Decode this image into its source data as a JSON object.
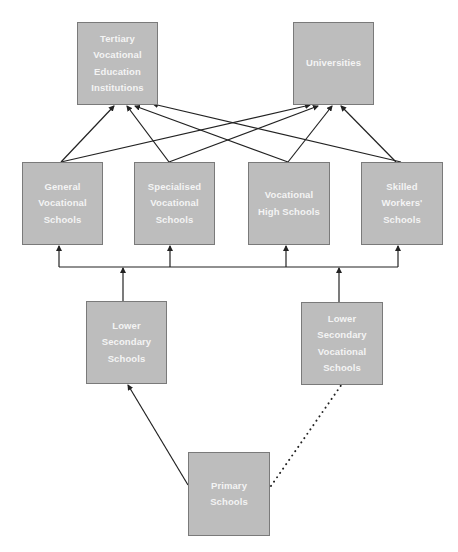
{
  "diagram": {
    "type": "flow",
    "colors": {
      "box_fill": "#bdbdbd",
      "box_border": "#7a7a7a",
      "box_text": "#f4f4f4",
      "edge": "#222222"
    },
    "nodes": [
      {
        "id": "tertiary",
        "label": "Tertiary\nVocational\nEducation\nInstitutions",
        "x": 77,
        "y": 22,
        "w": 81,
        "h": 83
      },
      {
        "id": "universities",
        "label": "Universities",
        "x": 293,
        "y": 22,
        "w": 81,
        "h": 83
      },
      {
        "id": "general_vocational",
        "label": "General\nVocational\nSchools",
        "x": 22,
        "y": 162,
        "w": 81,
        "h": 83
      },
      {
        "id": "specialised_vocational",
        "label": "Specialised\nVocational\nSchools",
        "x": 134,
        "y": 162,
        "w": 81,
        "h": 83
      },
      {
        "id": "vocational_high",
        "label": "Vocational\nHigh Schools",
        "x": 248,
        "y": 162,
        "w": 82,
        "h": 83
      },
      {
        "id": "skilled_workers",
        "label": "Skilled\nWorkers'\nSchools",
        "x": 361,
        "y": 162,
        "w": 82,
        "h": 83
      },
      {
        "id": "lower_secondary",
        "label": "Lower\nSecondary\nSchools",
        "x": 86,
        "y": 301,
        "w": 81,
        "h": 83
      },
      {
        "id": "lower_secondary_vocational",
        "label": "Lower\nSecondary\nVocational\nSchools",
        "x": 301,
        "y": 302,
        "w": 82,
        "h": 83
      },
      {
        "id": "primary",
        "label": "Primary\nSchools",
        "x": 188,
        "y": 452,
        "w": 82,
        "h": 84
      }
    ],
    "edges": [
      {
        "from": "general_vocational",
        "to": "tertiary",
        "style": "solid-arrow"
      },
      {
        "from": "general_vocational",
        "to": "universities",
        "style": "solid-arrow"
      },
      {
        "from": "specialised_vocational",
        "to": "tertiary",
        "style": "solid-arrow"
      },
      {
        "from": "specialised_vocational",
        "to": "universities",
        "style": "solid-arrow"
      },
      {
        "from": "vocational_high",
        "to": "tertiary",
        "style": "solid-arrow"
      },
      {
        "from": "vocational_high",
        "to": "universities",
        "style": "solid-arrow"
      },
      {
        "from": "skilled_workers",
        "to": "tertiary",
        "style": "solid-arrow"
      },
      {
        "from": "skilled_workers",
        "to": "universities",
        "style": "solid-arrow"
      },
      {
        "from": "lower_secondary",
        "to": "upper_secondary_bus",
        "style": "solid-arrow"
      },
      {
        "from": "lower_secondary_vocational",
        "to": "upper_secondary_bus",
        "style": "solid-arrow"
      },
      {
        "from": "upper_secondary_bus",
        "to": "general_vocational",
        "style": "solid-arrow"
      },
      {
        "from": "upper_secondary_bus",
        "to": "specialised_vocational",
        "style": "solid-arrow"
      },
      {
        "from": "upper_secondary_bus",
        "to": "vocational_high",
        "style": "solid-arrow"
      },
      {
        "from": "upper_secondary_bus",
        "to": "skilled_workers",
        "style": "solid-arrow"
      },
      {
        "from": "primary",
        "to": "lower_secondary",
        "style": "solid-arrow"
      },
      {
        "from": "primary",
        "to": "lower_secondary_vocational",
        "style": "dotted"
      }
    ]
  }
}
